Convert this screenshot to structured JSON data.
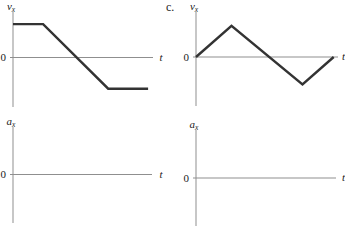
{
  "figure": {
    "part_label": "c.",
    "background": "#ffffff",
    "axis_color": "#8f8f8f",
    "curve_color": "#333333",
    "label_color": "#1a1a1a"
  },
  "chart_data": [
    {
      "id": "velocity-graph-left",
      "type": "line",
      "title": "",
      "ylabel": "v_x",
      "xlabel": "t",
      "origin_label": "0",
      "xlim": [
        0,
        10
      ],
      "ylim": [
        -3.1,
        3.1
      ],
      "grid": false,
      "legend": false,
      "shape_note": "constant positive velocity, then linear decrease through zero to constant negative velocity",
      "series": [
        {
          "name": "vx",
          "x": [
            0,
            2.15,
            6.8,
            9.65
          ],
          "y": [
            2.2,
            2.2,
            -2.05,
            -2.05
          ]
        }
      ],
      "px": {
        "origin_x": 13,
        "zero_y": 57.5,
        "x_axis_start": 10,
        "x_axis_end": 153,
        "y_axis_top": 12,
        "y_axis_bottom": 107,
        "x_per_unit": 14.0,
        "y_per_unit": 15.2,
        "t_label_x": 159.5
      }
    },
    {
      "id": "velocity-graph-right",
      "type": "line",
      "title": "",
      "ylabel": "v_x",
      "xlabel": "t",
      "origin_label": "0",
      "xlim": [
        0,
        10
      ],
      "ylim": [
        -3.1,
        3.1
      ],
      "grid": false,
      "legend": false,
      "shape_note": "triangle wave: linear rise from zero to positive peak, linear fall through zero to negative minimum, linear rise back to zero",
      "series": [
        {
          "name": "vx",
          "x": [
            0,
            2.5,
            7.5,
            9.7
          ],
          "y": [
            0,
            2.05,
            -1.8,
            0
          ]
        }
      ],
      "px": {
        "origin_x": 196,
        "zero_y": 57,
        "x_axis_start": 193,
        "x_axis_end": 338,
        "y_axis_top": 12,
        "y_axis_bottom": 106,
        "x_per_unit": 14.2,
        "y_per_unit": 15.2,
        "t_label_x": 342
      }
    },
    {
      "id": "acceleration-graph-left",
      "type": "line",
      "title": "",
      "ylabel": "a_x",
      "xlabel": "t",
      "origin_label": "0",
      "xlim": [
        0,
        10
      ],
      "ylim": [
        -3.1,
        3.1
      ],
      "grid": false,
      "legend": false,
      "shape_note": "empty axes, no curve drawn",
      "series": [],
      "px": {
        "origin_x": 13,
        "zero_y": 174.5,
        "x_axis_start": 10,
        "x_axis_end": 152,
        "y_axis_top": 127,
        "y_axis_bottom": 223,
        "x_per_unit": 14.0,
        "y_per_unit": 15.2,
        "t_label_x": 159.5
      }
    },
    {
      "id": "acceleration-graph-right",
      "type": "line",
      "title": "",
      "ylabel": "a_x",
      "xlabel": "t",
      "origin_label": "0",
      "xlim": [
        0,
        10
      ],
      "ylim": [
        -3.1,
        3.1
      ],
      "grid": false,
      "legend": false,
      "shape_note": "empty axes, no curve drawn",
      "series": [],
      "px": {
        "origin_x": 196,
        "zero_y": 178,
        "x_axis_start": 193,
        "x_axis_end": 336,
        "y_axis_top": 130,
        "y_axis_bottom": 226,
        "x_per_unit": 14.0,
        "y_per_unit": 15.2,
        "t_label_x": 342
      }
    }
  ]
}
